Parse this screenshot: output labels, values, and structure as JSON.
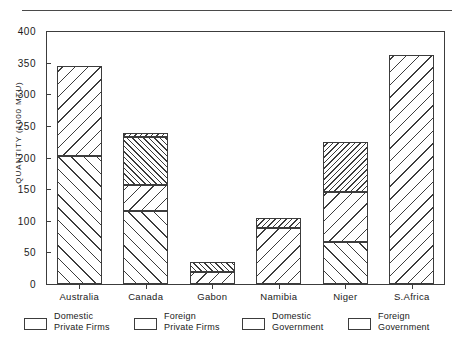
{
  "chart_data": {
    "type": "bar",
    "title": "",
    "subtitle": "",
    "xlabel": "",
    "ylabel": "QUANTITY (1000 MTU)",
    "ylim": [
      0,
      400
    ],
    "yticks": [
      0,
      50,
      100,
      150,
      200,
      250,
      300,
      350,
      400
    ],
    "grid": false,
    "stacked": true,
    "legend_position": "bottom",
    "categories": [
      "Australia",
      "Canada",
      "Gabon",
      "Namibia",
      "Niger",
      "S.Africa"
    ],
    "series": [
      {
        "name": "Domestic Private Firms",
        "pattern": "forward-hatch-wide",
        "values": [
          203,
          115,
          0,
          0,
          67,
          0
        ]
      },
      {
        "name": "Foreign Private Firms",
        "pattern": "back-hatch-wide",
        "values": [
          141,
          42,
          19,
          89,
          78,
          362
        ]
      },
      {
        "name": "Domestic Government",
        "pattern": "forward-hatch-dense",
        "values": [
          0,
          76,
          16,
          0,
          0,
          0
        ]
      },
      {
        "name": "Foreign Government",
        "pattern": "back-hatch-dense",
        "values": [
          0,
          5,
          0,
          15,
          80,
          0
        ]
      }
    ],
    "totals": [
      344,
      238,
      35,
      104,
      225,
      362
    ],
    "annotations": []
  },
  "axis": {
    "y_title": "QUANTITY (1000 MTU)",
    "y_tick_labels": [
      "0",
      "50",
      "100",
      "150",
      "200",
      "250",
      "300",
      "350",
      "400"
    ],
    "x_tick_labels": [
      "Australia",
      "Canada",
      "Gabon",
      "Namibia",
      "Niger",
      "S.Africa"
    ]
  },
  "legend": {
    "items": [
      {
        "line1": "Domestic",
        "line2": "Private Firms",
        "swatch": "forward-hatch-wide"
      },
      {
        "line1": "Foreign",
        "line2": "Private  Firms",
        "swatch": "back-hatch-wide"
      },
      {
        "line1": "Domestic",
        "line2": "Government",
        "swatch": "forward-hatch-dense"
      },
      {
        "line1": "Foreign",
        "line2": "Government",
        "swatch": "back-hatch-dense"
      }
    ]
  },
  "colors": {
    "ink": "#3c3c3c",
    "text": "#1a1a1a",
    "background": "#ffffff"
  }
}
